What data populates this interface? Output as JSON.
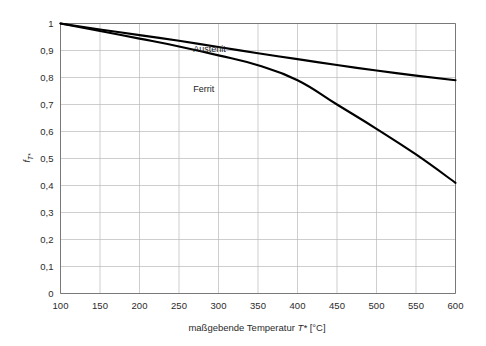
{
  "chart_data": {
    "type": "line",
    "title": "",
    "subtitle": "",
    "xlabel": "maßgebende Temperatur T* [°C]",
    "xlabel_parts": {
      "prefix": "maßgebende Temperatur ",
      "symbol": "T*",
      "suffix": " [°C]"
    },
    "ylabel": "f_T*",
    "ylabel_parts": {
      "base": "f",
      "subscript": "T*"
    },
    "xlim": [
      100,
      600
    ],
    "ylim": [
      0,
      1
    ],
    "xticks": [
      100,
      150,
      200,
      250,
      300,
      350,
      400,
      450,
      500,
      550,
      600
    ],
    "xtick_labels": [
      "100",
      "150",
      "200",
      "250",
      "300",
      "350",
      "400",
      "450",
      "500",
      "550",
      "600"
    ],
    "yticks": [
      0,
      0.1,
      0.2,
      0.3,
      0.4,
      0.5,
      0.6,
      0.7,
      0.8,
      0.9,
      1
    ],
    "ytick_labels": [
      "0",
      "0,1",
      "0,2",
      "0,3",
      "0,4",
      "0,5",
      "0,6",
      "0,7",
      "0,8",
      "0,9",
      "1"
    ],
    "grid": true,
    "grid_color": "#b9b9b9",
    "legend_position": "inline-annotations",
    "series": [
      {
        "name": "Austenit",
        "color": "#000000",
        "label_x": 430,
        "label_y": 0.905,
        "x": [
          100,
          150,
          200,
          250,
          300,
          350,
          400,
          450,
          500,
          550,
          600
        ],
        "values": [
          1.0,
          0.978,
          0.957,
          0.936,
          0.913,
          0.89,
          0.868,
          0.846,
          0.826,
          0.807,
          0.79
        ]
      },
      {
        "name": "Ferrit",
        "color": "#000000",
        "label_x": 430,
        "label_y": 0.756,
        "x": [
          100,
          150,
          200,
          250,
          300,
          350,
          400,
          450,
          500,
          550,
          600
        ],
        "values": [
          1.0,
          0.972,
          0.944,
          0.915,
          0.882,
          0.845,
          0.79,
          0.7,
          0.61,
          0.515,
          0.41
        ]
      }
    ],
    "annotations": [
      {
        "text": "Austenit",
        "x": 430,
        "y": 0.905
      },
      {
        "text": "Ferrit",
        "x": 430,
        "y": 0.756
      }
    ]
  }
}
